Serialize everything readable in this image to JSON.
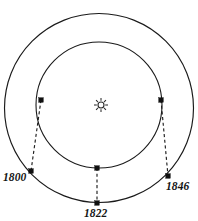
{
  "figure": {
    "title": "",
    "center_symbol": "sun-symbol",
    "orbits": [
      {
        "name": "outer-orbit",
        "cx": 99,
        "cy": 108,
        "r": 94.5
      },
      {
        "name": "inner-orbit",
        "cx": 99,
        "cy": 105,
        "r": 63
      }
    ],
    "observations": [
      {
        "year": "1800",
        "label_x": 3,
        "label_y": 181,
        "inner_x": 41,
        "inner_y": 100,
        "outer_x": 31,
        "outer_y": 171
      },
      {
        "year": "1822",
        "label_x": 84,
        "label_y": 217,
        "inner_x": 97,
        "inner_y": 168,
        "outer_x": 97,
        "outer_y": 203
      },
      {
        "year": "1846",
        "label_x": 166,
        "label_y": 190,
        "inner_x": 161,
        "inner_y": 100,
        "outer_x": 168,
        "outer_y": 176
      }
    ],
    "sun": {
      "cx": 101,
      "cy": 105,
      "disc_r": 3.0,
      "ray_inner": 4.2,
      "ray_outer": 7.0,
      "ray_count": 8
    },
    "colors": {
      "stroke": "#1a1a1a",
      "background": "#ffffff",
      "label": "#141414"
    }
  }
}
